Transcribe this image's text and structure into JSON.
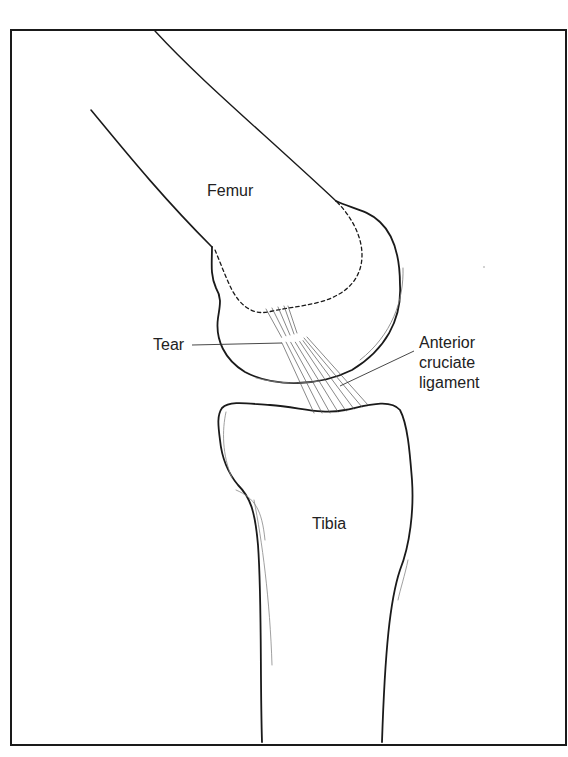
{
  "diagram": {
    "labels": {
      "femur": "Femur",
      "tibia": "Tibia",
      "tear": "Tear",
      "acl": [
        "Anterior",
        "cruciate",
        "ligament"
      ]
    },
    "colors": {
      "line": "#1a1a1a",
      "thin_line": "#555555",
      "text": "#222222",
      "background": "#ffffff"
    }
  }
}
